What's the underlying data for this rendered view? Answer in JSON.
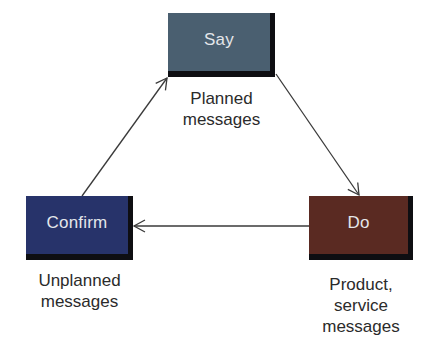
{
  "diagram": {
    "type": "cycle",
    "nodes": [
      {
        "id": "say",
        "label": "Say",
        "color": "#4a5f70",
        "caption": [
          "Planned",
          "messages"
        ]
      },
      {
        "id": "do",
        "label": "Do",
        "color": "#5a2a22",
        "caption": [
          "Product,",
          "service",
          "messages"
        ]
      },
      {
        "id": "confirm",
        "label": "Confirm",
        "color": "#27336a",
        "caption": [
          "Unplanned",
          "messages"
        ]
      }
    ],
    "edges": [
      {
        "from": "say",
        "to": "do"
      },
      {
        "from": "do",
        "to": "confirm"
      },
      {
        "from": "confirm",
        "to": "say"
      }
    ],
    "arrow_color": "#3a3a3a",
    "caption_color": "#2b2b2b",
    "node_text_color": "#e4e6ea"
  }
}
